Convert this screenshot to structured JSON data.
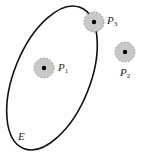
{
  "diagram": {
    "ellipse_label": "E",
    "points": [
      {
        "id": "P1",
        "letter": "P",
        "sub": "1",
        "cx": 44,
        "cy": 68
      },
      {
        "id": "P2",
        "letter": "P",
        "sub": "2",
        "cx": 125,
        "cy": 52
      },
      {
        "id": "P3",
        "letter": "P",
        "sub": "3",
        "cx": 94,
        "cy": 22
      }
    ],
    "colors": {
      "stroke": "#111111",
      "disk_fill": "#c8c8c8",
      "disk_stroke": "#888888"
    }
  }
}
